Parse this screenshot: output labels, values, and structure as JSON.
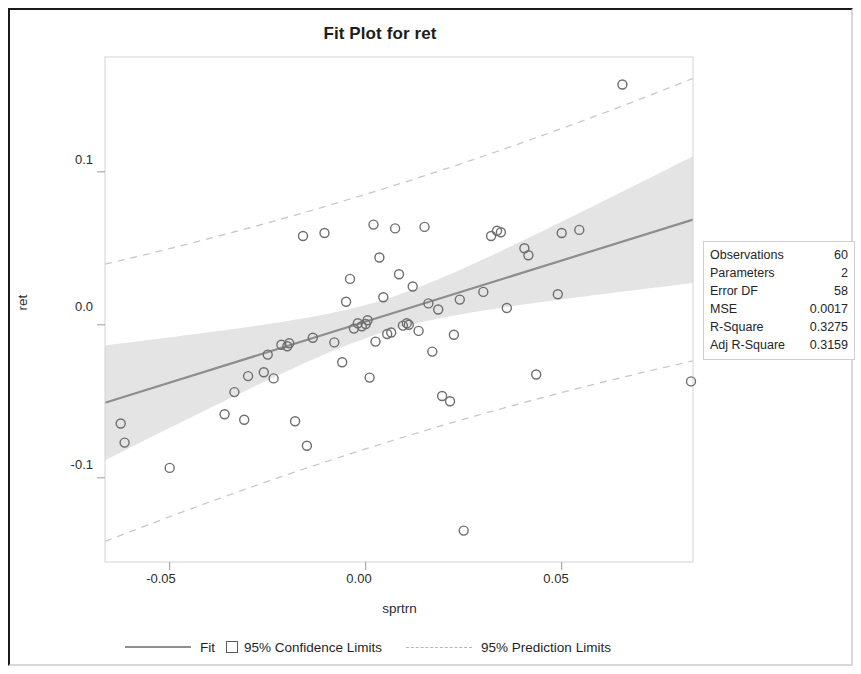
{
  "chart_data": {
    "type": "scatter",
    "title": "Fit Plot for ret",
    "xlabel": "sprtrn",
    "ylabel": "ret",
    "xlim": [
      -0.0665,
      0.0835
    ],
    "ylim": [
      -0.155,
      0.175
    ],
    "xticks": [
      -0.05,
      0.0,
      0.05
    ],
    "xticklabels": [
      "-0.05",
      "0.00",
      "0.05"
    ],
    "yticks": [
      0.1,
      0.0,
      -0.1
    ],
    "yticklabels": [
      "0.1",
      "0.0",
      "-0.1"
    ],
    "grid": false,
    "legend_position": "bottom",
    "fit": {
      "intercept": 0.0021,
      "slope": 0.798,
      "color": "#8e8e8e"
    },
    "confidence_band": {
      "level": "95%",
      "color": "#e3e3e3"
    },
    "prediction_band": {
      "level": "95%",
      "color": "#c8c8c8",
      "style": "dashed"
    },
    "marker": {
      "shape": "circle-open",
      "edge_color": "#6e6e6e",
      "size": 9
    },
    "points": [
      {
        "x": -0.0625,
        "y": -0.0645
      },
      {
        "x": -0.0615,
        "y": -0.077
      },
      {
        "x": -0.05,
        "y": -0.0935
      },
      {
        "x": -0.036,
        "y": -0.0585
      },
      {
        "x": -0.0335,
        "y": -0.044
      },
      {
        "x": -0.031,
        "y": -0.062
      },
      {
        "x": -0.03,
        "y": -0.0335
      },
      {
        "x": -0.026,
        "y": -0.031
      },
      {
        "x": -0.025,
        "y": -0.0195
      },
      {
        "x": -0.0235,
        "y": -0.035
      },
      {
        "x": -0.0215,
        "y": -0.013
      },
      {
        "x": -0.02,
        "y": -0.014
      },
      {
        "x": -0.0195,
        "y": -0.012
      },
      {
        "x": -0.018,
        "y": -0.063
      },
      {
        "x": -0.016,
        "y": 0.058
      },
      {
        "x": -0.015,
        "y": -0.079
      },
      {
        "x": -0.0135,
        "y": -0.0085
      },
      {
        "x": -0.0105,
        "y": 0.06
      },
      {
        "x": -0.008,
        "y": -0.0115
      },
      {
        "x": -0.006,
        "y": -0.0245
      },
      {
        "x": -0.005,
        "y": 0.015
      },
      {
        "x": -0.004,
        "y": 0.03
      },
      {
        "x": -0.003,
        "y": -0.0025
      },
      {
        "x": -0.002,
        "y": 0.001
      },
      {
        "x": -0.001,
        "y": -0.001
      },
      {
        "x": 0.0,
        "y": 0.0005
      },
      {
        "x": 0.0005,
        "y": 0.003
      },
      {
        "x": 0.001,
        "y": -0.0345
      },
      {
        "x": 0.002,
        "y": 0.0655
      },
      {
        "x": 0.0025,
        "y": -0.011
      },
      {
        "x": 0.0035,
        "y": 0.044
      },
      {
        "x": 0.0045,
        "y": 0.018
      },
      {
        "x": 0.0055,
        "y": -0.006
      },
      {
        "x": 0.0065,
        "y": -0.005
      },
      {
        "x": 0.0075,
        "y": 0.063
      },
      {
        "x": 0.0085,
        "y": 0.033
      },
      {
        "x": 0.0095,
        "y": -0.0005
      },
      {
        "x": 0.0105,
        "y": 0.001
      },
      {
        "x": 0.011,
        "y": 0.0
      },
      {
        "x": 0.012,
        "y": 0.025
      },
      {
        "x": 0.0135,
        "y": -0.004
      },
      {
        "x": 0.015,
        "y": 0.064
      },
      {
        "x": 0.016,
        "y": 0.014
      },
      {
        "x": 0.017,
        "y": -0.0175
      },
      {
        "x": 0.0185,
        "y": 0.01
      },
      {
        "x": 0.0195,
        "y": -0.0465
      },
      {
        "x": 0.0215,
        "y": -0.05
      },
      {
        "x": 0.0225,
        "y": -0.0065
      },
      {
        "x": 0.024,
        "y": 0.0165
      },
      {
        "x": 0.025,
        "y": -0.1345
      },
      {
        "x": 0.03,
        "y": 0.0215
      },
      {
        "x": 0.032,
        "y": 0.058
      },
      {
        "x": 0.0335,
        "y": 0.0615
      },
      {
        "x": 0.0345,
        "y": 0.0605
      },
      {
        "x": 0.036,
        "y": 0.011
      },
      {
        "x": 0.0405,
        "y": 0.05
      },
      {
        "x": 0.0415,
        "y": 0.0455
      },
      {
        "x": 0.0435,
        "y": -0.0325
      },
      {
        "x": 0.049,
        "y": 0.02
      },
      {
        "x": 0.05,
        "y": 0.06
      },
      {
        "x": 0.0545,
        "y": 0.062
      },
      {
        "x": 0.0655,
        "y": 0.157
      },
      {
        "x": 0.083,
        "y": -0.037
      }
    ]
  },
  "stats": {
    "rows": [
      {
        "label": "Observations",
        "value": "60"
      },
      {
        "label": "Parameters",
        "value": "2"
      },
      {
        "label": "Error DF",
        "value": "58"
      },
      {
        "label": "MSE",
        "value": "0.0017"
      },
      {
        "label": "R-Square",
        "value": "0.3275"
      },
      {
        "label": "Adj R-Square",
        "value": "0.3159"
      }
    ]
  },
  "legend": {
    "fit_label": "Fit",
    "confidence_label": "95% Confidence Limits",
    "prediction_label": "95% Prediction Limits"
  }
}
